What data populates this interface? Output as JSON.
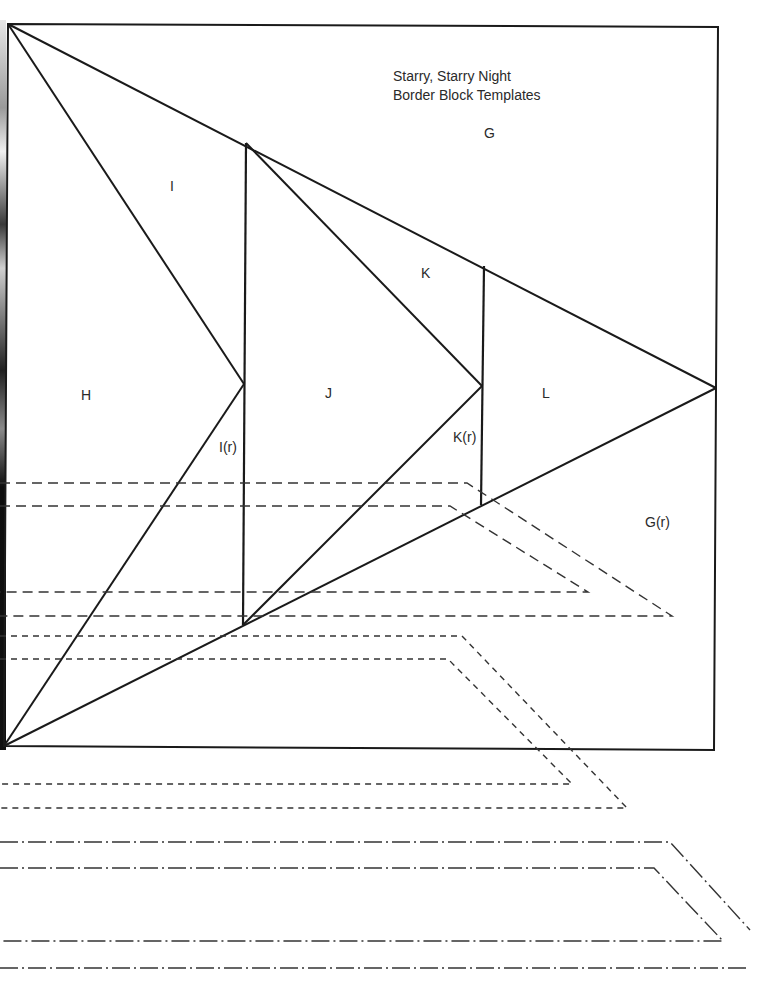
{
  "title": {
    "line1": "Starry, Starry Night",
    "line2": "Border Block Templates"
  },
  "labels": {
    "G": "G",
    "G_r": "G(r)",
    "H": "H",
    "I": "I",
    "I_r": "I(r)",
    "J": "J",
    "K": "K",
    "K_r": "K(r)",
    "L": "L"
  },
  "colors": {
    "line": "#1a1a1a",
    "background": "#ffffff"
  }
}
